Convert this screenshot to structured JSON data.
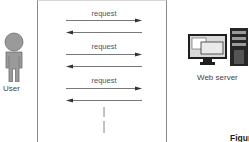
{
  "diagram": {
    "type": "sequence",
    "actors": {
      "left": {
        "label": "User",
        "icon": "user-icon"
      },
      "right": {
        "label": "Web server",
        "icon": "web-server-icon"
      }
    },
    "messages": [
      {
        "direction": "right",
        "label": "request"
      },
      {
        "direction": "left",
        "label": ""
      },
      {
        "direction": "right",
        "label": "request"
      },
      {
        "direction": "left",
        "label": ""
      },
      {
        "direction": "right",
        "label": "request"
      },
      {
        "direction": "left",
        "label": ""
      }
    ],
    "continuation": "dashed-vertical",
    "caption": "Figure 5.2("
  },
  "colors": {
    "line": "#555555",
    "icon_gray": "#8c8c8c",
    "icon_dark": "#222222",
    "border": "#8a8a8a"
  }
}
